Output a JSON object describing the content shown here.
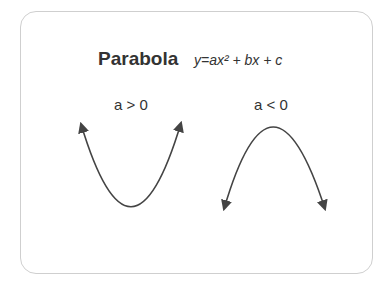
{
  "diagram": {
    "title": "Parabola",
    "formula": "y=ax² + bx + c",
    "cases": [
      {
        "label": "a > 0",
        "shape": "opens-up"
      },
      {
        "label": "a < 0",
        "shape": "opens-down"
      }
    ],
    "colors": {
      "stroke": "#444444",
      "text": "#333333",
      "border": "#cfcfcf"
    }
  }
}
